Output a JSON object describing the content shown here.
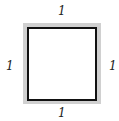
{
  "diagram": {
    "shape": "square",
    "labels": {
      "top": "1",
      "bottom": "1",
      "left": "1",
      "right": "1"
    },
    "colors": {
      "outer_border": "#d0d0d0",
      "inner_border": "#111111",
      "fill": "#ffffff"
    }
  }
}
